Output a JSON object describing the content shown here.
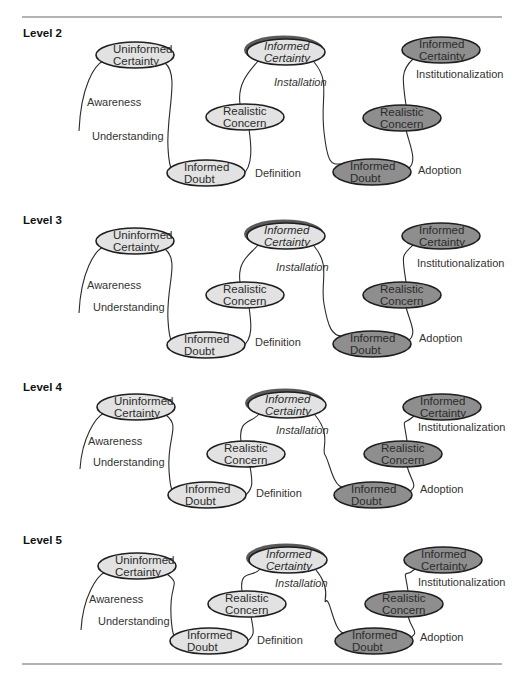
{
  "colors": {
    "light": "#e2e2e2",
    "dark": "#8e8e8e"
  },
  "rules": {
    "top_y": 17,
    "bottom_y": 664,
    "x1": 22,
    "x2": 502
  },
  "node_labels": {
    "uninformed_certainty": [
      "Uninformed",
      "Certainty"
    ],
    "informed_certainty": [
      "Informed",
      "Certainty"
    ],
    "realistic_concern": [
      "Realistic",
      "Concern"
    ],
    "informed_doubt": [
      "Informed",
      "Doubt"
    ]
  },
  "edge_labels": {
    "awareness": "Awareness",
    "understanding": "Understanding",
    "definition": "Definition",
    "installation": "Installation",
    "institutionalization": "Institutionalization",
    "adoption": "Adoption"
  },
  "levels": [
    {
      "label": "Level 2",
      "label_y": 37,
      "uc": [
        135,
        55
      ],
      "ic1": [
        286,
        52
      ],
      "ic2": [
        441,
        50
      ],
      "rc1": [
        245,
        117
      ],
      "rc2": [
        402,
        118
      ],
      "id1": [
        206,
        173
      ],
      "id2": [
        372,
        172
      ],
      "line_bottom": [
        79,
        131
      ],
      "awareness": [
        87,
        106
      ],
      "understanding": [
        92,
        140
      ],
      "definition": [
        255,
        177
      ],
      "installation": [
        274,
        86
      ],
      "institutionalization": [
        416,
        78
      ],
      "adoption": [
        418,
        174
      ]
    },
    {
      "label": "Level 3",
      "label_y": 224,
      "uc": [
        135,
        241
      ],
      "ic1": [
        286,
        236
      ],
      "ic2": [
        441,
        236
      ],
      "rc1": [
        245,
        295
      ],
      "rc2": [
        402,
        295
      ],
      "id1": [
        206,
        345
      ],
      "id2": [
        372,
        344
      ],
      "line_bottom": [
        79,
        313
      ],
      "awareness": [
        87,
        289
      ],
      "understanding": [
        93,
        311
      ],
      "definition": [
        255,
        346
      ],
      "installation": [
        276,
        271
      ],
      "institutionalization": [
        417,
        267
      ],
      "adoption": [
        419,
        342
      ]
    },
    {
      "label": "Level 4",
      "label_y": 391,
      "uc": [
        136,
        407
      ],
      "ic1": [
        287,
        405
      ],
      "ic2": [
        442,
        407
      ],
      "rc1": [
        246,
        454
      ],
      "rc2": [
        403,
        454
      ],
      "id1": [
        207,
        495
      ],
      "id2": [
        373,
        495
      ],
      "line_bottom": [
        80,
        469
      ],
      "awareness": [
        88,
        445
      ],
      "understanding": [
        93,
        466
      ],
      "definition": [
        256,
        497
      ],
      "installation": [
        276,
        434
      ],
      "institutionalization": [
        418,
        431
      ],
      "adoption": [
        420,
        493
      ]
    },
    {
      "label": "Level 5",
      "label_y": 544,
      "uc": [
        137,
        566
      ],
      "ic1": [
        288,
        560
      ],
      "ic2": [
        443,
        560
      ],
      "rc1": [
        247,
        604
      ],
      "rc2": [
        404,
        604
      ],
      "id1": [
        209,
        641
      ],
      "id2": [
        374,
        641
      ],
      "line_bottom": [
        81,
        630
      ],
      "awareness": [
        89,
        603
      ],
      "understanding": [
        98,
        625
      ],
      "definition": [
        257,
        644
      ],
      "installation": [
        275,
        587
      ],
      "institutionalization": [
        418,
        586
      ],
      "adoption": [
        420,
        641
      ]
    }
  ]
}
